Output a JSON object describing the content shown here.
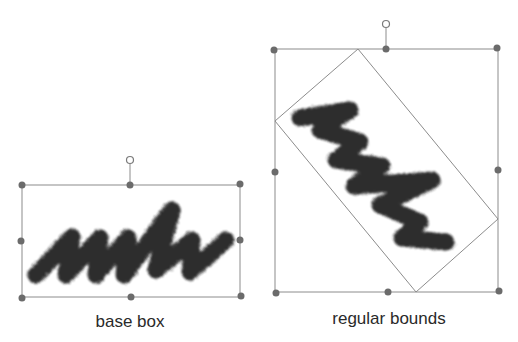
{
  "figures": [
    {
      "id": "base-box",
      "label": "base box",
      "label_pos": [
        130,
        312
      ],
      "bounds": {
        "x1": 22,
        "y1": 185,
        "x2": 240,
        "y2": 297
      },
      "rotation_handle": [
        130,
        160
      ]
    },
    {
      "id": "regular-bounds",
      "label": "regular bounds",
      "label_pos": [
        389,
        309
      ],
      "bounds": {
        "x1": 275,
        "y1": 49,
        "x2": 498,
        "y2": 292
      },
      "rotation_handle": [
        386,
        24
      ],
      "rotated_rect": [
        [
          358,
          49
        ],
        [
          498,
          219
        ],
        [
          416,
          292
        ],
        [
          275,
          121
        ]
      ]
    }
  ],
  "colors": {
    "frame": "#8c8c8c",
    "handle": "#6b6b6b",
    "ink": "#1a1a1a"
  }
}
